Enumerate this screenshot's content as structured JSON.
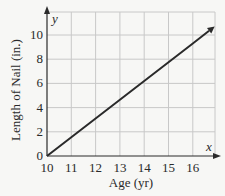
{
  "chart_data": {
    "type": "line",
    "title": "",
    "xlabel": "Age (yr)",
    "ylabel": "Length of Nail (in.)",
    "x_axis_name": "x",
    "y_axis_name": "y",
    "xlim": [
      10,
      17
    ],
    "ylim": [
      0,
      11
    ],
    "x_ticks": [
      10,
      11,
      12,
      13,
      14,
      15,
      16
    ],
    "y_ticks": [
      0,
      2,
      4,
      6,
      8,
      10
    ],
    "grid": true,
    "legend": null,
    "series": [
      {
        "name": "Length of Nail",
        "x": [
          10,
          11,
          12,
          13,
          14,
          15,
          16,
          16.9
        ],
        "y": [
          0,
          1.55,
          3.1,
          4.65,
          6.2,
          7.75,
          9.3,
          10.7
        ],
        "arrow_end": true,
        "color": "#2a2a2a"
      }
    ]
  },
  "colors": {
    "grid": "#c8c8c8",
    "axis": "#2a2a2a",
    "background": "#f7f7f5"
  }
}
